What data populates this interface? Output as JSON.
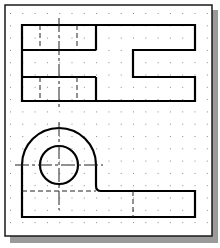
{
  "diagram": {
    "type": "orthographic-projection",
    "views": [
      "top-view",
      "front-view"
    ],
    "colors": {
      "background": "#ffffff",
      "frame": "#1a1a1a",
      "shadow": "#9a9a9a",
      "grid_dot": "#8a8a8a",
      "object_line": "#000000",
      "hidden_line": "#222222",
      "center_line": "#222222"
    },
    "grid": {
      "spacing": 12.3,
      "origin_x": 10,
      "origin_y": 13
    }
  }
}
